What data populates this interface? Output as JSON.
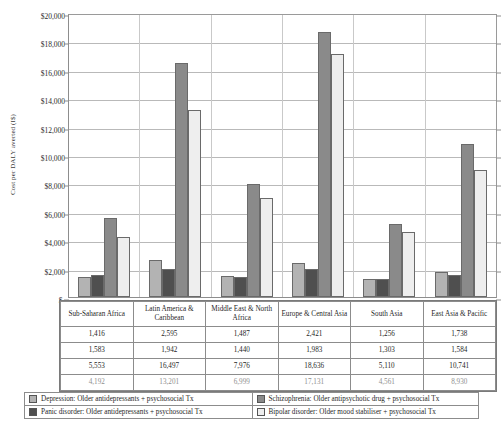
{
  "chart_data": {
    "type": "bar",
    "title": "",
    "xlabel": "",
    "ylabel": "Cost per DALY averted (I$)",
    "ylim": [
      0,
      20000
    ],
    "ytick_labels": [
      "$20,000",
      "$18,000",
      "$16,000",
      "$14,000",
      "$12,000",
      "$10,000",
      "$8,000",
      "$6,000",
      "$4,000",
      "$2,000",
      "$-"
    ],
    "ytick_values": [
      20000,
      18000,
      16000,
      14000,
      12000,
      10000,
      8000,
      6000,
      4000,
      2000,
      0
    ],
    "grid": true,
    "legend_position": "bottom",
    "categories": [
      "Sub-Saharan Africa",
      "Latin America & Caribbean",
      "Middle East & North Africa",
      "Europe & Central Asia",
      "South Asia",
      "East Asia & Pacific"
    ],
    "series": [
      {
        "name": "Depression: Older antidepressants + psychosocial Tx",
        "color": "#b3b3b3",
        "values": [
          1416,
          2595,
          1487,
          2421,
          1256,
          1738
        ]
      },
      {
        "name": "Panic disorder: Older antidepressants + psychosocial Tx",
        "color": "#4f4f4f",
        "values": [
          1583,
          1942,
          1440,
          1983,
          1303,
          1584
        ]
      },
      {
        "name": "Schizophrenia: Older antipsychotic drug + psychosocial Tx",
        "color": "#8a8a8a",
        "values": [
          5553,
          16497,
          7976,
          18636,
          5110,
          10741
        ]
      },
      {
        "name": "Bipolar disorder: Older mood stabiliser + psychosocial Tx",
        "color": "#eeeeee",
        "values": [
          4192,
          13201,
          6999,
          17131,
          4561,
          8930
        ]
      }
    ]
  },
  "table": {
    "header": [
      "Sub-Saharan Africa",
      "Latin America & Caribbean",
      "Middle East & North Africa",
      "Europe & Central Asia",
      "South Asia",
      "East Asia & Pacific"
    ],
    "rows": [
      [
        "1,416",
        "2,595",
        "1,487",
        "2,421",
        "1,256",
        "1,738"
      ],
      [
        "1,583",
        "1,942",
        "1,440",
        "1,983",
        "1,303",
        "1,584"
      ],
      [
        "5,553",
        "16,497",
        "7,976",
        "18,636",
        "5,110",
        "10,741"
      ],
      [
        "4,192",
        "13,201",
        "6,999",
        "17,131",
        "4,561",
        "8,930"
      ]
    ]
  },
  "legend": {
    "items": [
      {
        "label": "Depression: Older antidepressants + psychosocial Tx",
        "color": "#b3b3b3"
      },
      {
        "label": "Schizophrenia: Older antipsychotic drug + psychosocial Tx",
        "color": "#8a8a8a"
      },
      {
        "label": "Panic disorder: Older antidepressants + psychosocial Tx",
        "color": "#4f4f4f"
      },
      {
        "label": "Bipolar disorder: Older mood stabiliser + psychosocial Tx",
        "color": "#eeeeee"
      }
    ]
  }
}
